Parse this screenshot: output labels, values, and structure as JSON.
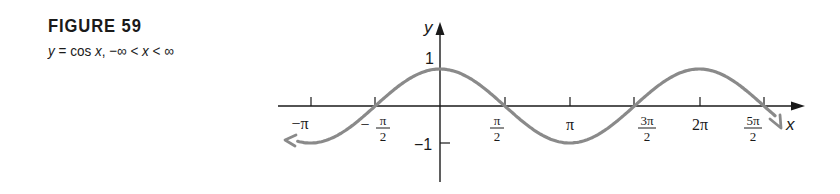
{
  "figure": {
    "title": "FIGURE 59",
    "caption_y": "y",
    "caption_eq": " = cos ",
    "caption_x": "x",
    "caption_domain": ", −∞ < ",
    "caption_x2": "x",
    "caption_end": " < ∞"
  },
  "colors": {
    "curve": "#8a8a8a",
    "axes": "#1a1a1a"
  },
  "chart_data": {
    "type": "line",
    "title": "FIGURE 59",
    "subtitle": "y = cos x, −∞ < x < ∞",
    "function": "cos(x)",
    "xlabel": "x",
    "ylabel": "y",
    "x_ticks": [
      {
        "value": -3.14159,
        "label": "−π"
      },
      {
        "value": -1.5708,
        "label": "−π/2"
      },
      {
        "value": 1.5708,
        "label": "π/2"
      },
      {
        "value": 3.14159,
        "label": "π"
      },
      {
        "value": 4.71239,
        "label": "3π/2"
      },
      {
        "value": 6.28319,
        "label": "2π"
      },
      {
        "value": 7.85398,
        "label": "5π/2"
      }
    ],
    "y_ticks": [
      {
        "value": 1,
        "label": "1"
      },
      {
        "value": -1,
        "label": "−1"
      }
    ],
    "xlim": [
      -3.6,
      8.3
    ],
    "ylim": [
      -1.7,
      2.6
    ],
    "x": [
      -3.6,
      -3.14159,
      -1.5708,
      0,
      1.5708,
      3.14159,
      4.71239,
      6.28319,
      7.85398,
      8.2
    ],
    "y": [
      -0.897,
      -1,
      0,
      1,
      0,
      -1,
      0,
      1,
      0,
      -0.34
    ],
    "grid": false,
    "legend": "none",
    "arrows_on_both_ends": true
  },
  "labels": {
    "y_axis": "y",
    "x_axis": "x",
    "y_one": "1",
    "y_neg_one": "−1",
    "neg_pi": "−π",
    "neg_half_pi_sign": "−",
    "neg_half_pi_num": "π",
    "neg_half_pi_den": "2",
    "half_pi_num": "π",
    "half_pi_den": "2",
    "pi": "π",
    "three_half_pi_num": "3π",
    "three_half_pi_den": "2",
    "two_pi": "2π",
    "five_half_pi_num": "5π",
    "five_half_pi_den": "2"
  }
}
